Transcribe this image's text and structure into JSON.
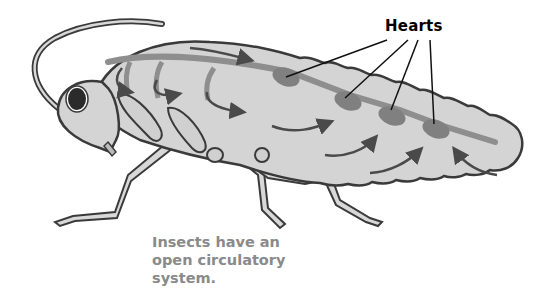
{
  "diagram": {
    "label": "Hearts",
    "caption_lines": [
      "Insects have an",
      "open circulatory",
      "system."
    ],
    "colors": {
      "body_fill": "#d4d4d4",
      "outline": "#3a3a3a",
      "vessel": "#8e8e8e",
      "heart": "#808080",
      "arrow": "#4a4a4a",
      "caption": "#8a8a8a"
    },
    "heart_count": 4
  }
}
